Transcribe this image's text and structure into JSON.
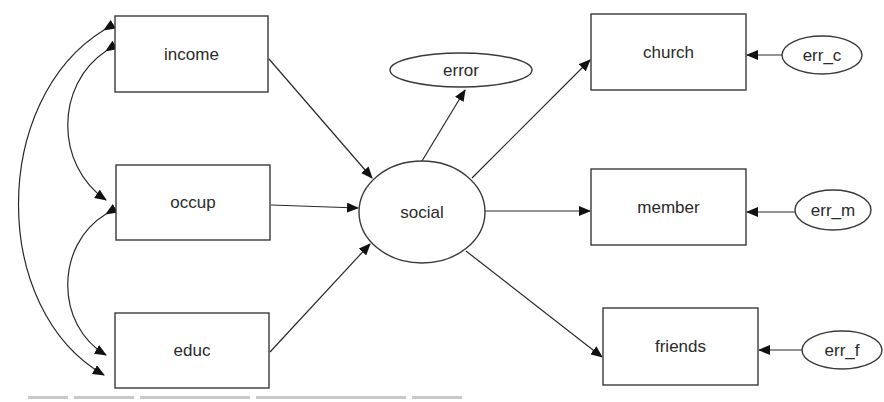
{
  "diagram": {
    "type": "structural-equation-path-diagram",
    "colors": {
      "stroke": "#3a3a3a",
      "fill": "#ffffff",
      "text": "#2a2a2a"
    },
    "nodes": {
      "income": {
        "label": "income",
        "shape": "rect"
      },
      "occup": {
        "label": "occup",
        "shape": "rect"
      },
      "educ": {
        "label": "educ",
        "shape": "rect"
      },
      "social": {
        "label": "social",
        "shape": "ellipse"
      },
      "error": {
        "label": "error",
        "shape": "ellipse"
      },
      "church": {
        "label": "church",
        "shape": "rect"
      },
      "member": {
        "label": "member",
        "shape": "rect"
      },
      "friends": {
        "label": "friends",
        "shape": "rect"
      },
      "err_c": {
        "label": "err_c",
        "shape": "ellipse"
      },
      "err_m": {
        "label": "err_m",
        "shape": "ellipse"
      },
      "err_f": {
        "label": "err_f",
        "shape": "ellipse"
      }
    },
    "edges": [
      {
        "from": "income",
        "to": "social",
        "kind": "directed"
      },
      {
        "from": "occup",
        "to": "social",
        "kind": "directed"
      },
      {
        "from": "educ",
        "to": "social",
        "kind": "directed"
      },
      {
        "from": "social",
        "to": "error",
        "kind": "directed"
      },
      {
        "from": "social",
        "to": "church",
        "kind": "directed"
      },
      {
        "from": "social",
        "to": "member",
        "kind": "directed"
      },
      {
        "from": "social",
        "to": "friends",
        "kind": "directed"
      },
      {
        "from": "err_c",
        "to": "church",
        "kind": "directed"
      },
      {
        "from": "err_m",
        "to": "member",
        "kind": "directed"
      },
      {
        "from": "err_f",
        "to": "friends",
        "kind": "directed"
      },
      {
        "from": "income",
        "to": "occup",
        "kind": "covariance"
      },
      {
        "from": "occup",
        "to": "educ",
        "kind": "covariance"
      },
      {
        "from": "income",
        "to": "educ",
        "kind": "covariance"
      }
    ]
  }
}
